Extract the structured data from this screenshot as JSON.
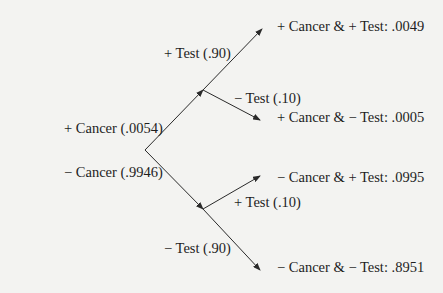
{
  "diagram": {
    "type": "probability-tree",
    "root": {
      "branches": [
        {
          "label": "+ Cancer (.0054)",
          "branches": [
            {
              "label": "+ Test (.90)",
              "outcome": "+ Cancer & + Test: .0049"
            },
            {
              "label": "− Test (.10)",
              "outcome": "+ Cancer & − Test: .0005"
            }
          ]
        },
        {
          "label": "− Cancer (.9946)",
          "branches": [
            {
              "label": "+ Test (.10)",
              "outcome": "− Cancer & + Test: .0995"
            },
            {
              "label": "− Test (.90)",
              "outcome": "− Cancer & − Test: .8951"
            }
          ]
        }
      ]
    }
  },
  "colors": {
    "background": "#f3f3f1",
    "lines": "#2a2a2a",
    "text": "#1e1e1e"
  }
}
